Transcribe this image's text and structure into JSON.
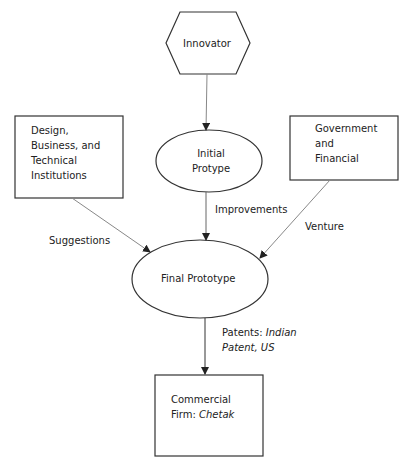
{
  "diagram": {
    "nodes": {
      "innovator": {
        "label": "Innovator",
        "shape": "hexagon"
      },
      "design_inst": {
        "lines": [
          "Design,",
          "Business, and",
          "Technical",
          "Institutions"
        ],
        "shape": "rectangle"
      },
      "government": {
        "lines": [
          "Government",
          "and",
          "Financial"
        ],
        "shape": "rectangle"
      },
      "initial": {
        "lines": [
          "Initial",
          "Protype"
        ],
        "shape": "ellipse"
      },
      "final": {
        "label": "Final Prototype",
        "shape": "ellipse"
      },
      "commercial": {
        "line1": "Commercial",
        "line2_prefix": "Firm: ",
        "line2_italic": "Chetak",
        "shape": "rectangle"
      }
    },
    "edges": {
      "improvements": "Improvements",
      "suggestions": "Suggestions",
      "venture": "Venture",
      "patents_prefix": "Patents: ",
      "patents_italic1": "Indian",
      "patents_italic2": "Patent, US"
    }
  }
}
